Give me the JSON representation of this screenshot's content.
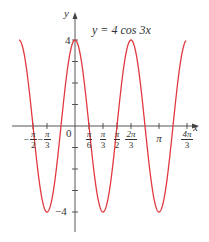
{
  "chart_data": {
    "type": "line",
    "title": "y = 4 cos 3x",
    "function": "y = 4*cos(3*x)",
    "xlabel": "x",
    "ylabel": "y",
    "xlim": [
      -2.2,
      4.5
    ],
    "ylim": [
      -5,
      5
    ],
    "grid": false,
    "series": [
      {
        "name": "y = 4 cos 3x",
        "color": "#e0393e",
        "x": [
          -2.1,
          -1.5708,
          -1.0472,
          -0.5236,
          0,
          0.5236,
          1.0472,
          1.5708,
          2.0944,
          2.618,
          3.1416,
          3.6652,
          4.1888,
          4.4
        ],
        "values": [
          4.0,
          0,
          -4,
          0,
          4,
          0,
          -4,
          0,
          4,
          0,
          -4,
          0,
          4,
          4.0
        ]
      }
    ],
    "x_ticks": [
      {
        "value": -1.5708,
        "sign": "−",
        "num": "π",
        "den": "2"
      },
      {
        "value": -1.0472,
        "sign": "−",
        "num": "π",
        "den": "3"
      },
      {
        "value": 0.5236,
        "sign": "",
        "num": "π",
        "den": "6"
      },
      {
        "value": 1.0472,
        "sign": "",
        "num": "π",
        "den": "3"
      },
      {
        "value": 1.5708,
        "sign": "",
        "num": "π",
        "den": "2"
      },
      {
        "value": 2.0944,
        "sign": "",
        "num": "2π",
        "den": "3"
      },
      {
        "value": 3.1416,
        "sign": "",
        "num": "π",
        "den": ""
      },
      {
        "value": 4.1888,
        "sign": "",
        "num": "4π",
        "den": "3"
      }
    ],
    "y_ticks": [
      -4,
      -3,
      -2,
      -1,
      1,
      2,
      3,
      4
    ],
    "y_tick_labels": {
      "4": "4",
      "-4": "−4"
    },
    "origin_label": "0",
    "amplitude": 4,
    "period": "2π/3"
  },
  "labels": {
    "equation": "y = 4 cos 3x",
    "y_axis": "y",
    "x_axis": "x",
    "origin": "0",
    "y_max": "4",
    "y_min": "−4",
    "pi": "π"
  },
  "colors": {
    "curve": "#e0393e",
    "axis": "#444444"
  }
}
